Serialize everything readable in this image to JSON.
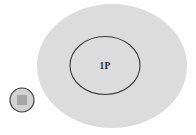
{
  "diagram": {
    "background_color": "#fefefe",
    "outer_region": {
      "name": "outer-ellipse",
      "label": "",
      "fill_color": "#dcdcdc",
      "stroke_color": "none",
      "cx": 112,
      "cy": 66,
      "rx": 75,
      "ry": 62
    },
    "inner_region": {
      "name": "inner-ellipse",
      "label": "1P",
      "fill_color": "none",
      "stroke_color": "#3a3a3a",
      "stroke_width": 1.1,
      "cx": 105,
      "cy": 65.5,
      "rx": 35,
      "ry": 29,
      "label_x": 105,
      "label_y": 69
    },
    "external_node": {
      "name": "external-node",
      "label": "",
      "circle_fill_color": "#d2d2d2",
      "circle_stroke_color": "#3a3a3a",
      "circle_stroke_width": 1.1,
      "cx": 22,
      "cy": 100,
      "r": 12,
      "square_fill_color": "#a6a6a6",
      "square_x": 17,
      "square_y": 95,
      "square_size": 10
    }
  }
}
